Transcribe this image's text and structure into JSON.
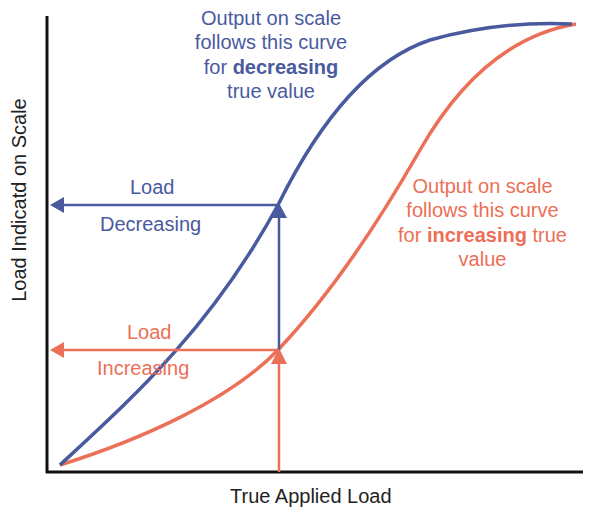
{
  "diagram": {
    "type": "hysteresis-curve",
    "axes": {
      "x_label": "True Applied Load",
      "y_label": "Load Indicatd on Scale"
    },
    "curves": [
      {
        "name": "decreasing",
        "color": "#4a5a9e",
        "annotation": {
          "line1": "Output on scale",
          "line2": "follows this curve",
          "line3_pre": "for ",
          "line3_bold": "decreasing",
          "line4": "true value"
        }
      },
      {
        "name": "increasing",
        "color": "#ec6f57",
        "annotation": {
          "line1": "Output on scale",
          "line2": "follows this curve",
          "line3_pre": "for ",
          "line3_bold": "increasing",
          "line3_post": " true",
          "line4": "value"
        }
      }
    ],
    "arrows": {
      "decreasing": {
        "label_top": "Load",
        "label_bottom": "Decreasing",
        "color": "#4a5a9e"
      },
      "increasing": {
        "label_top": "Load",
        "label_bottom": "Increasing",
        "color": "#ec6f57"
      }
    }
  }
}
